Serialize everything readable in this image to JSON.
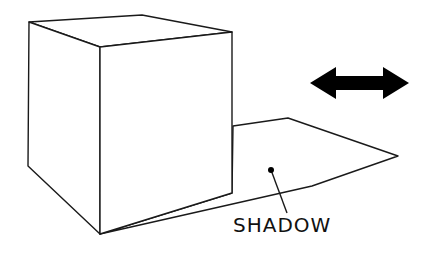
{
  "diagram": {
    "type": "illustration",
    "labels": {
      "shadow": "SHADOW"
    },
    "icons": {
      "double_arrow": "left-right-double-arrow"
    },
    "colors": {
      "line": "#1a1a1a",
      "fill": "#ffffff",
      "arrow": "#000000"
    }
  }
}
